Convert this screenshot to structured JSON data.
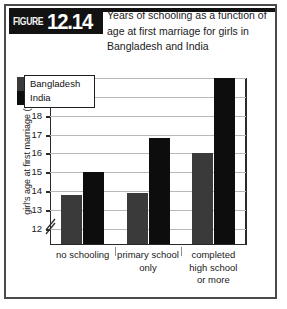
{
  "figure": {
    "badge_word": "FIGURE",
    "badge_number": "12.14",
    "title": "Years of schooling as a function of age at first marriage for girls in Bangladesh and India"
  },
  "chart_data": {
    "type": "bar",
    "title": "Years of schooling as a function of age at first marriage for girls in Bangladesh and India",
    "xlabel": "",
    "ylabel": "girl's age at first marriage (years)",
    "ylim": [
      11.2,
      20
    ],
    "yticks": [
      12,
      13,
      14,
      15,
      16,
      17,
      18,
      19,
      20
    ],
    "ytick_labels": [
      "12",
      "13",
      "14",
      "15",
      "16",
      "17",
      "18",
      "19",
      "20"
    ],
    "axis_break": true,
    "grid": true,
    "legend_position": "top-left",
    "categories": [
      "no schooling",
      "primary school only",
      "completed high school or more"
    ],
    "series": [
      {
        "name": "Bangladesh",
        "color": "#3a3a3a",
        "values": [
          13.8,
          13.9,
          16.0
        ]
      },
      {
        "name": "India",
        "color": "#0d0d0d",
        "values": [
          15.0,
          16.8,
          20.0
        ]
      }
    ]
  }
}
